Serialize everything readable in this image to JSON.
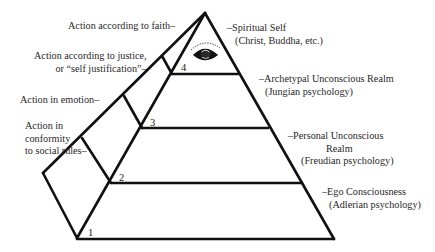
{
  "diagram": {
    "title": "",
    "left_labels": [
      {
        "id": "faith",
        "lines": [
          "Action according to faith–"
        ]
      },
      {
        "id": "justice",
        "lines": [
          "Action according to justice,",
          "or “self  justification”–"
        ]
      },
      {
        "id": "emotion",
        "lines": [
          "Action in emotion–"
        ]
      },
      {
        "id": "conformity",
        "lines": [
          "Action in",
          "conformity",
          "to social rules–"
        ]
      }
    ],
    "right_labels": [
      {
        "id": "spiritual-self",
        "lines": [
          "–Spiritual Self",
          "(Christ, Buddha, etc.)"
        ]
      },
      {
        "id": "archetypal",
        "lines": [
          "–Archetypal Unconscious Realm",
          "(Jungian psychology)"
        ]
      },
      {
        "id": "personal",
        "lines": [
          "–Personal Unconscious",
          "Realm",
          "(Freudian psychology)"
        ]
      },
      {
        "id": "ego",
        "lines": [
          "–Ego Consciousness",
          "(Adlerian psychology)"
        ]
      }
    ],
    "level_numbers": [
      "1",
      "2",
      "3",
      "4"
    ],
    "apex_icon": "eye-icon",
    "colors": {
      "line": "#111111",
      "text": "#1f1f1f",
      "background": "#ffffff"
    }
  }
}
